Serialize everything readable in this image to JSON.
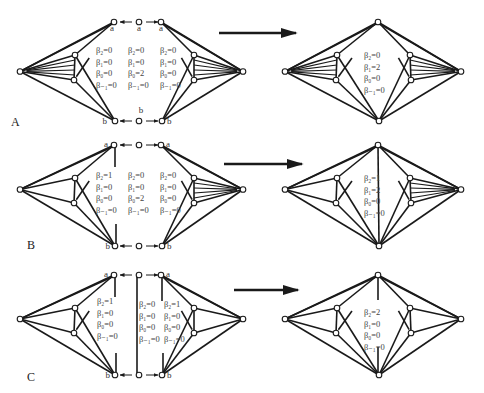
{
  "figure": {
    "rows": [
      {
        "id": "A",
        "label": "A",
        "y_top": 22,
        "y_bottom": 121,
        "before": {
          "vertex_labels": {
            "top_left": "a",
            "top_mid": "a",
            "top_right": "a",
            "bottom_left": "b",
            "bottom_mid": "b",
            "bottom_right": "b"
          },
          "betti_left": [
            "β₂=0",
            "β₁=0",
            "β₀=0",
            "β₋₁=0"
          ],
          "betti_middle": [
            "β₂=0",
            "β₁=0",
            "β₀=2",
            "β₋₁=0"
          ],
          "betti_right": [
            "β₂=0",
            "β₁=0",
            "β₀=0",
            "β₋₁=0"
          ],
          "left_hatched": true,
          "right_hatched": true
        },
        "after": {
          "betti": [
            "β₂=0",
            "β₁=2",
            "β₀=0",
            "β₋₁=0"
          ],
          "left_hatched": true,
          "right_hatched": true,
          "center_edge": false
        }
      },
      {
        "id": "B",
        "label": "B",
        "y_top": 145,
        "y_bottom": 246,
        "before": {
          "vertex_labels": {
            "top_left": "a",
            "top_right": "a",
            "bottom_left": "b",
            "bottom_right": "b"
          },
          "betti_left": [
            "β₂=1",
            "β₁=0",
            "β₀=0",
            "β₋₁=0"
          ],
          "betti_middle": [
            "β₂=0",
            "β₁=0",
            "β₀=2",
            "β₋₁=0"
          ],
          "betti_right": [
            "β₂=0",
            "β₁=0",
            "β₀=0",
            "β₋₁=0"
          ],
          "left_hatched": false,
          "right_hatched": true
        },
        "after": {
          "betti": [
            "β₂=1",
            "β₁=2",
            "β₀=0",
            "β₋₁=0"
          ],
          "left_hatched": false,
          "right_hatched": true,
          "center_edge": true
        }
      },
      {
        "id": "C",
        "label": "C",
        "y_top": 275,
        "y_bottom": 375,
        "before": {
          "vertex_labels": {
            "top_left": "a",
            "top_right": "a",
            "bottom_left": "b",
            "bottom_right": "b"
          },
          "betti_left": [
            "β₂=1",
            "β₁=0",
            "β₀=0",
            "β₋₁=0"
          ],
          "betti_middle": [
            "β₂=0",
            "β₁=0",
            "β₀=0",
            "β₋₁=0"
          ],
          "betti_right": [
            "β₂=1",
            "β₁=0",
            "β₀=0",
            "β₋₁=0"
          ],
          "left_hatched": false,
          "right_hatched": false
        },
        "after": {
          "betti": [
            "β₂=2",
            "β₁=0",
            "β₀=0",
            "β₋₁=0"
          ],
          "left_hatched": false,
          "right_hatched": false,
          "center_edge": true
        }
      }
    ],
    "colors": {
      "stroke": "#1a1a1a",
      "text": "#444444",
      "background": "#ffffff"
    }
  }
}
